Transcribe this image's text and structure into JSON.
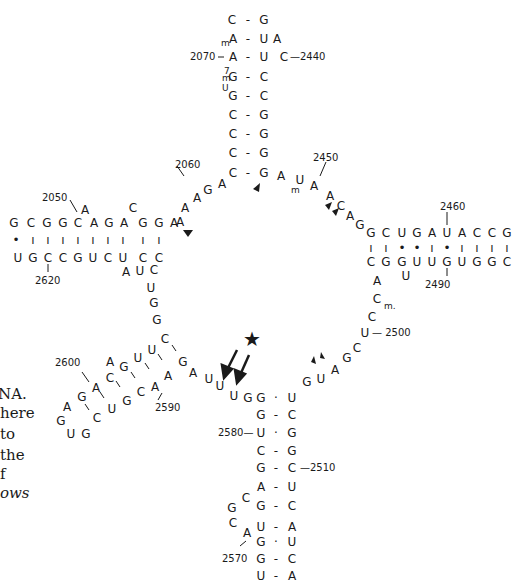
{
  "figure": {
    "caption_fragments": [
      "NA.",
      "here",
      "to",
      "the",
      "f",
      "ows"
    ],
    "star_symbol": "★",
    "colors": {
      "ink": "#1a1a1a",
      "background": "#ffffff"
    }
  },
  "nucleotides": [
    {
      "id": "s1",
      "t": "C",
      "x": 232,
      "y": 20
    },
    {
      "id": "s2",
      "t": "G",
      "x": 264,
      "y": 20
    },
    {
      "id": "s3",
      "t": "A",
      "x": 233,
      "y": 39
    },
    {
      "id": "s4",
      "t": "U",
      "x": 264,
      "y": 39
    },
    {
      "id": "s5",
      "t": "A",
      "x": 277,
      "y": 39
    },
    {
      "id": "s6",
      "t": "A",
      "x": 233,
      "y": 57
    },
    {
      "id": "s7",
      "t": "U",
      "x": 264,
      "y": 57
    },
    {
      "id": "s8",
      "t": "C",
      "x": 284,
      "y": 57
    },
    {
      "id": "s9",
      "t": "G",
      "x": 233,
      "y": 77
    },
    {
      "id": "s10",
      "t": "C",
      "x": 264,
      "y": 77
    },
    {
      "id": "s11",
      "t": "G",
      "x": 233,
      "y": 96
    },
    {
      "id": "s12",
      "t": "C",
      "x": 264,
      "y": 96
    },
    {
      "id": "s13",
      "t": "C",
      "x": 233,
      "y": 115
    },
    {
      "id": "s14",
      "t": "G",
      "x": 264,
      "y": 115
    },
    {
      "id": "s15",
      "t": "C",
      "x": 233,
      "y": 134
    },
    {
      "id": "s16",
      "t": "G",
      "x": 264,
      "y": 134
    },
    {
      "id": "s17",
      "t": "C",
      "x": 233,
      "y": 173
    },
    {
      "id": "s18",
      "t": "G",
      "x": 264,
      "y": 173
    },
    {
      "id": "s17b",
      "t": "C",
      "x": 233,
      "y": 153
    },
    {
      "id": "s18b",
      "t": "G",
      "x": 264,
      "y": 153
    },
    {
      "id": "j1",
      "t": "A",
      "x": 222,
      "y": 184
    },
    {
      "id": "j2",
      "t": "G",
      "x": 208,
      "y": 190
    },
    {
      "id": "j3",
      "t": "A",
      "x": 197,
      "y": 198
    },
    {
      "id": "j4",
      "t": "A",
      "x": 185,
      "y": 208
    },
    {
      "id": "j5",
      "t": "A",
      "x": 180,
      "y": 222
    },
    {
      "id": "r1",
      "t": "A",
      "x": 281,
      "y": 176
    },
    {
      "id": "r2",
      "t": "U",
      "x": 300,
      "y": 180
    },
    {
      "id": "r3",
      "t": "A",
      "x": 314,
      "y": 186
    },
    {
      "id": "r4",
      "t": "A",
      "x": 330,
      "y": 196
    },
    {
      "id": "r5",
      "t": "C",
      "x": 341,
      "y": 206
    },
    {
      "id": "r6",
      "t": "A",
      "x": 350,
      "y": 216
    },
    {
      "id": "r7",
      "t": "G",
      "x": 360,
      "y": 225
    },
    {
      "id": "lt1",
      "t": "G",
      "x": 14,
      "y": 223
    },
    {
      "id": "lt2",
      "t": "C",
      "x": 31,
      "y": 223
    },
    {
      "id": "lt3",
      "t": "G",
      "x": 47,
      "y": 223
    },
    {
      "id": "lt4",
      "t": "G",
      "x": 63,
      "y": 223
    },
    {
      "id": "lt5",
      "t": "C",
      "x": 78,
      "y": 223
    },
    {
      "id": "lt5a",
      "t": "A",
      "x": 85,
      "y": 210
    },
    {
      "id": "lt6",
      "t": "A",
      "x": 94,
      "y": 223
    },
    {
      "id": "lt7",
      "t": "G",
      "x": 109,
      "y": 223
    },
    {
      "id": "lt8",
      "t": "A",
      "x": 124,
      "y": 223
    },
    {
      "id": "lt8a",
      "t": "C",
      "x": 133,
      "y": 208
    },
    {
      "id": "lt9",
      "t": "G",
      "x": 143,
      "y": 223
    },
    {
      "id": "lt10",
      "t": "G",
      "x": 159,
      "y": 223
    },
    {
      "id": "lt11",
      "t": "A",
      "x": 174,
      "y": 223
    },
    {
      "id": "lb1",
      "t": "U",
      "x": 18,
      "y": 258
    },
    {
      "id": "lb2",
      "t": "G",
      "x": 33,
      "y": 258
    },
    {
      "id": "lb3",
      "t": "C",
      "x": 48,
      "y": 258
    },
    {
      "id": "lb4",
      "t": "C",
      "x": 63,
      "y": 258
    },
    {
      "id": "lb5",
      "t": "G",
      "x": 78,
      "y": 258
    },
    {
      "id": "lb6",
      "t": "U",
      "x": 93,
      "y": 258
    },
    {
      "id": "lb7",
      "t": "C",
      "x": 108,
      "y": 258
    },
    {
      "id": "lb8",
      "t": "U",
      "x": 123,
      "y": 258
    },
    {
      "id": "lb8a",
      "t": "A",
      "x": 126,
      "y": 272
    },
    {
      "id": "lb9",
      "t": "C",
      "x": 143,
      "y": 258
    },
    {
      "id": "lb9a",
      "t": "U",
      "x": 140,
      "y": 271
    },
    {
      "id": "lb10",
      "t": "C",
      "x": 159,
      "y": 258
    },
    {
      "id": "lb11",
      "t": "C",
      "x": 154,
      "y": 270
    },
    {
      "id": "d1",
      "t": "U",
      "x": 151,
      "y": 288
    },
    {
      "id": "d2",
      "t": "G",
      "x": 154,
      "y": 303
    },
    {
      "id": "d3",
      "t": "G",
      "x": 157,
      "y": 320
    },
    {
      "id": "rt1",
      "t": "G",
      "x": 371,
      "y": 233
    },
    {
      "id": "rt2",
      "t": "C",
      "x": 386,
      "y": 233
    },
    {
      "id": "rt3",
      "t": "U",
      "x": 402,
      "y": 233
    },
    {
      "id": "rt4",
      "t": "G",
      "x": 417,
      "y": 233
    },
    {
      "id": "rt5",
      "t": "A",
      "x": 432,
      "y": 233
    },
    {
      "id": "rt6",
      "t": "U",
      "x": 447,
      "y": 233
    },
    {
      "id": "rt7",
      "t": "A",
      "x": 462,
      "y": 233
    },
    {
      "id": "rt8",
      "t": "C",
      "x": 477,
      "y": 233
    },
    {
      "id": "rt9",
      "t": "C",
      "x": 492,
      "y": 233
    },
    {
      "id": "rt10",
      "t": "G",
      "x": 507,
      "y": 233
    },
    {
      "id": "rt11",
      "t": "C",
      "x": 522,
      "y": 233
    },
    {
      "id": "rb1",
      "t": "C",
      "x": 371,
      "y": 262
    },
    {
      "id": "rb2",
      "t": "G",
      "x": 386,
      "y": 262
    },
    {
      "id": "rb3",
      "t": "G",
      "x": 402,
      "y": 262
    },
    {
      "id": "rb3a",
      "t": "U",
      "x": 406,
      "y": 276
    },
    {
      "id": "rb4",
      "t": "U",
      "x": 417,
      "y": 262
    },
    {
      "id": "rb5",
      "t": "U",
      "x": 432,
      "y": 262
    },
    {
      "id": "rb6",
      "t": "G",
      "x": 447,
      "y": 262
    },
    {
      "id": "rb7",
      "t": "U",
      "x": 462,
      "y": 262
    },
    {
      "id": "rb8",
      "t": "G",
      "x": 477,
      "y": 262
    },
    {
      "id": "rb9",
      "t": "G",
      "x": 492,
      "y": 262
    },
    {
      "id": "rb10",
      "t": "C",
      "x": 507,
      "y": 262
    },
    {
      "id": "rb11",
      "t": "G",
      "x": 522,
      "y": 262
    },
    {
      "id": "dr1",
      "t": "A",
      "x": 377,
      "y": 281
    },
    {
      "id": "dr2",
      "t": "C",
      "x": 377,
      "y": 299
    },
    {
      "id": "dr3",
      "t": "C",
      "x": 372,
      "y": 317
    },
    {
      "id": "dr4",
      "t": "U",
      "x": 365,
      "y": 333
    },
    {
      "id": "dr5",
      "t": "C",
      "x": 357,
      "y": 348
    },
    {
      "id": "dr6",
      "t": "G",
      "x": 347,
      "y": 358
    },
    {
      "id": "dr7",
      "t": "A",
      "x": 335,
      "y": 370
    },
    {
      "id": "dr8",
      "t": "U",
      "x": 321,
      "y": 379
    },
    {
      "id": "dr9",
      "t": "G",
      "x": 307,
      "y": 382
    },
    {
      "id": "lo1",
      "t": "C",
      "x": 165,
      "y": 339
    },
    {
      "id": "lo2",
      "t": "U",
      "x": 152,
      "y": 350
    },
    {
      "id": "lo3",
      "t": "G",
      "x": 183,
      "y": 362
    },
    {
      "id": "lo4",
      "t": "A",
      "x": 193,
      "y": 373
    },
    {
      "id": "lo5",
      "t": "U",
      "x": 209,
      "y": 379
    },
    {
      "id": "lo6",
      "t": "U",
      "x": 220,
      "y": 386
    },
    {
      "id": "lo7",
      "t": "U",
      "x": 234,
      "y": 396
    },
    {
      "id": "lo8",
      "t": "G",
      "x": 248,
      "y": 398
    },
    {
      "id": "lo9",
      "t": "G",
      "x": 261,
      "y": 398
    },
    {
      "id": "lo10",
      "t": "U",
      "x": 292,
      "y": 398
    },
    {
      "id": "h1",
      "t": "A",
      "x": 110,
      "y": 362
    },
    {
      "id": "h2",
      "t": "G",
      "x": 124,
      "y": 367
    },
    {
      "id": "h3",
      "t": "U",
      "x": 138,
      "y": 358
    },
    {
      "id": "h4",
      "t": "C",
      "x": 110,
      "y": 378
    },
    {
      "id": "h5",
      "t": "A",
      "x": 168,
      "y": 376
    },
    {
      "id": "h6",
      "t": "C",
      "x": 141,
      "y": 392
    },
    {
      "id": "h7",
      "t": "A",
      "x": 155,
      "y": 387
    },
    {
      "id": "h8",
      "t": "A",
      "x": 96,
      "y": 388
    },
    {
      "id": "h9",
      "t": "G",
      "x": 82,
      "y": 397
    },
    {
      "id": "h10",
      "t": "G",
      "x": 127,
      "y": 401
    },
    {
      "id": "h11",
      "t": "U",
      "x": 112,
      "y": 409
    },
    {
      "id": "h12",
      "t": "A",
      "x": 67,
      "y": 407
    },
    {
      "id": "h13",
      "t": "G",
      "x": 61,
      "y": 421
    },
    {
      "id": "h14",
      "t": "C",
      "x": 97,
      "y": 418
    },
    {
      "id": "h15",
      "t": "U",
      "x": 71,
      "y": 434
    },
    {
      "id": "h16",
      "t": "G",
      "x": 86,
      "y": 434
    },
    {
      "id": "b1",
      "t": "G",
      "x": 261,
      "y": 415
    },
    {
      "id": "b2",
      "t": "C",
      "x": 292,
      "y": 415
    },
    {
      "id": "b3",
      "t": "U",
      "x": 261,
      "y": 433
    },
    {
      "id": "b4",
      "t": "G",
      "x": 292,
      "y": 433
    },
    {
      "id": "b5",
      "t": "C",
      "x": 261,
      "y": 451
    },
    {
      "id": "b6",
      "t": "G",
      "x": 292,
      "y": 451
    },
    {
      "id": "b7",
      "t": "G",
      "x": 261,
      "y": 468
    },
    {
      "id": "b8",
      "t": "C",
      "x": 292,
      "y": 468
    },
    {
      "id": "b9",
      "t": "A",
      "x": 261,
      "y": 487
    },
    {
      "id": "b10",
      "t": "U",
      "x": 292,
      "y": 487
    },
    {
      "id": "b11",
      "t": "G",
      "x": 261,
      "y": 506
    },
    {
      "id": "b12",
      "t": "C",
      "x": 292,
      "y": 506
    },
    {
      "id": "b13",
      "t": "U",
      "x": 261,
      "y": 527
    },
    {
      "id": "b14",
      "t": "A",
      "x": 292,
      "y": 527
    },
    {
      "id": "b15",
      "t": "G",
      "x": 261,
      "y": 542
    },
    {
      "id": "b16",
      "t": "U",
      "x": 292,
      "y": 542
    },
    {
      "id": "b17",
      "t": "G",
      "x": 261,
      "y": 559
    },
    {
      "id": "b18",
      "t": "C",
      "x": 292,
      "y": 559
    },
    {
      "id": "b19",
      "t": "U",
      "x": 261,
      "y": 576
    },
    {
      "id": "b20",
      "t": "A",
      "x": 292,
      "y": 576
    },
    {
      "id": "bl1",
      "t": "C",
      "x": 246,
      "y": 498
    },
    {
      "id": "bl2",
      "t": "G",
      "x": 232,
      "y": 508
    },
    {
      "id": "bl3",
      "t": "C",
      "x": 233,
      "y": 523
    },
    {
      "id": "bl4",
      "t": "A",
      "x": 247,
      "y": 533
    }
  ],
  "pair_marks": [
    {
      "x": 248,
      "y": 20,
      "t": "-"
    },
    {
      "x": 248,
      "y": 39,
      "t": "-"
    },
    {
      "x": 248,
      "y": 57,
      "t": "-"
    },
    {
      "x": 248,
      "y": 77,
      "t": "-"
    },
    {
      "x": 248,
      "y": 96,
      "t": "-"
    },
    {
      "x": 248,
      "y": 115,
      "t": "-"
    },
    {
      "x": 248,
      "y": 134,
      "t": "-"
    },
    {
      "x": 248,
      "y": 153,
      "t": "-"
    },
    {
      "x": 248,
      "y": 173,
      "t": "-"
    },
    {
      "x": 276,
      "y": 398,
      "t": "·"
    },
    {
      "x": 276,
      "y": 415,
      "t": "-"
    },
    {
      "x": 276,
      "y": 433,
      "t": "·"
    },
    {
      "x": 276,
      "y": 451,
      "t": "-"
    },
    {
      "x": 276,
      "y": 468,
      "t": "-"
    },
    {
      "x": 276,
      "y": 487,
      "t": "-"
    },
    {
      "x": 276,
      "y": 506,
      "t": "-"
    },
    {
      "x": 276,
      "y": 527,
      "t": "-"
    },
    {
      "x": 276,
      "y": 542,
      "t": "·"
    },
    {
      "x": 276,
      "y": 559,
      "t": "-"
    },
    {
      "x": 276,
      "y": 576,
      "t": "-"
    },
    {
      "x": 16,
      "y": 240,
      "t": "•"
    },
    {
      "x": 33,
      "y": 240,
      "t": "ı"
    },
    {
      "x": 48,
      "y": 240,
      "t": "ı"
    },
    {
      "x": 63,
      "y": 240,
      "t": "ı"
    },
    {
      "x": 78,
      "y": 240,
      "t": "ı"
    },
    {
      "x": 93,
      "y": 240,
      "t": "ı"
    },
    {
      "x": 108,
      "y": 240,
      "t": "ı"
    },
    {
      "x": 123,
      "y": 240,
      "t": "ı"
    },
    {
      "x": 143,
      "y": 240,
      "t": "ı"
    },
    {
      "x": 159,
      "y": 240,
      "t": "ı"
    },
    {
      "x": 371,
      "y": 248,
      "t": "ı"
    },
    {
      "x": 386,
      "y": 248,
      "t": "ı"
    },
    {
      "x": 402,
      "y": 248,
      "t": "•"
    },
    {
      "x": 417,
      "y": 248,
      "t": "•"
    },
    {
      "x": 432,
      "y": 248,
      "t": "ı"
    },
    {
      "x": 447,
      "y": 248,
      "t": "•"
    },
    {
      "x": 462,
      "y": 248,
      "t": "ı"
    },
    {
      "x": 477,
      "y": 248,
      "t": "ı"
    },
    {
      "x": 492,
      "y": 248,
      "t": "ı"
    },
    {
      "x": 507,
      "y": 248,
      "t": "ı"
    }
  ],
  "modifications": [
    {
      "id": "mA",
      "t": "m",
      "x": 221,
      "y": 39
    },
    {
      "id": "m7G",
      "t": "m",
      "x": 222,
      "y": 74
    },
    {
      "id": "m7G_7",
      "t": "7",
      "x": 224,
      "y": 67
    },
    {
      "id": "mU_psi",
      "t": "U",
      "x": 222,
      "y": 84
    },
    {
      "id": "mU2449",
      "t": "m",
      "x": 291,
      "y": 186
    },
    {
      "id": "Cm",
      "t": "m.",
      "x": 384,
      "y": 302
    }
  ],
  "labels": [
    {
      "t": "2070",
      "x": 190,
      "y": 52
    },
    {
      "t": "—2440",
      "x": 290,
      "y": 52
    },
    {
      "t": "2060",
      "x": 175,
      "y": 160
    },
    {
      "t": "2450",
      "x": 313,
      "y": 153
    },
    {
      "t": "2050",
      "x": 42,
      "y": 193
    },
    {
      "t": "2460",
      "x": 440,
      "y": 202
    },
    {
      "t": "2620",
      "x": 35,
      "y": 276
    },
    {
      "t": "2490",
      "x": 425,
      "y": 280
    },
    {
      "t": "— 2500",
      "x": 372,
      "y": 328
    },
    {
      "t": "2600",
      "x": 55,
      "y": 358
    },
    {
      "t": "2590",
      "x": 155,
      "y": 403
    },
    {
      "t": "2580—",
      "x": 218,
      "y": 428
    },
    {
      "t": "—2510",
      "x": 300,
      "y": 463
    },
    {
      "t": "2570",
      "x": 222,
      "y": 554
    }
  ],
  "captions": [
    {
      "t": "NA.",
      "x": -2,
      "y": 385,
      "italic": false
    },
    {
      "t": "here",
      "x": 0,
      "y": 404,
      "italic": false
    },
    {
      "t": "to",
      "x": 0,
      "y": 425,
      "italic": false
    },
    {
      "t": "the",
      "x": 0,
      "y": 446,
      "italic": false
    },
    {
      "t": "f",
      "x": 0,
      "y": 465,
      "italic": false
    },
    {
      "t": "ows",
      "x": 0,
      "y": 484,
      "italic": true
    }
  ]
}
